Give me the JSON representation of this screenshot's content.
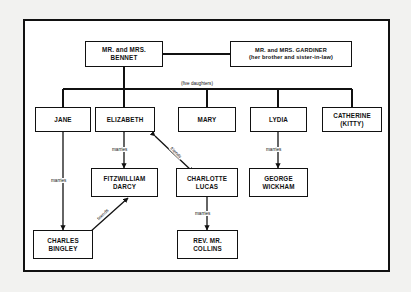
{
  "diagram": {
    "frame": {
      "border_color": "#111111",
      "background": "#ffffff"
    },
    "page_background": "#f2f2f0"
  },
  "nodes": {
    "bennet": {
      "label": "MR. and MRS.\nBENNET"
    },
    "gardiner": {
      "label": "MR. and MRS. GARDINER\n(her brother and sister-in-law)"
    },
    "jane": {
      "label": "JANE"
    },
    "elizabeth": {
      "label": "ELIZABETH"
    },
    "mary": {
      "label": "MARY"
    },
    "lydia": {
      "label": "LYDIA"
    },
    "catherine": {
      "label": "CATHERINE\n(KITTY)"
    },
    "darcy": {
      "label": "FITZWILLIAM\nDARCY"
    },
    "charlotte": {
      "label": "CHARLOTTE\nLUCAS"
    },
    "wickham": {
      "label": "GEORGE\nWICKHAM"
    },
    "bingley": {
      "label": "CHARLES\nBINGLEY"
    },
    "collins": {
      "label": "REV. MR.\nCOLLINS"
    }
  },
  "edge_labels": {
    "five_daughters": "(five daughters)",
    "jane_bingley": "marries",
    "elizabeth_darcy": "marries",
    "elizabeth_charlotte": "friends",
    "bingley_darcy": "friends",
    "charlotte_collins": "marries",
    "lydia_wickham": "marries"
  },
  "relationships": [
    {
      "from": "bennet",
      "to": "gardiner",
      "type": "sibling-in-law",
      "label": ""
    },
    {
      "from": "bennet",
      "to": "jane",
      "type": "parent-child",
      "label": "(five daughters)"
    },
    {
      "from": "bennet",
      "to": "elizabeth",
      "type": "parent-child",
      "label": ""
    },
    {
      "from": "bennet",
      "to": "mary",
      "type": "parent-child",
      "label": ""
    },
    {
      "from": "bennet",
      "to": "lydia",
      "type": "parent-child",
      "label": ""
    },
    {
      "from": "bennet",
      "to": "catherine",
      "type": "parent-child",
      "label": ""
    },
    {
      "from": "jane",
      "to": "bingley",
      "type": "marries",
      "label": "marries"
    },
    {
      "from": "elizabeth",
      "to": "darcy",
      "type": "marries",
      "label": "marries"
    },
    {
      "from": "elizabeth",
      "to": "charlotte",
      "type": "friends",
      "label": "friends"
    },
    {
      "from": "bingley",
      "to": "darcy",
      "type": "friends",
      "label": "friends"
    },
    {
      "from": "charlotte",
      "to": "collins",
      "type": "marries",
      "label": "marries"
    },
    {
      "from": "lydia",
      "to": "wickham",
      "type": "marries",
      "label": "marries"
    }
  ]
}
